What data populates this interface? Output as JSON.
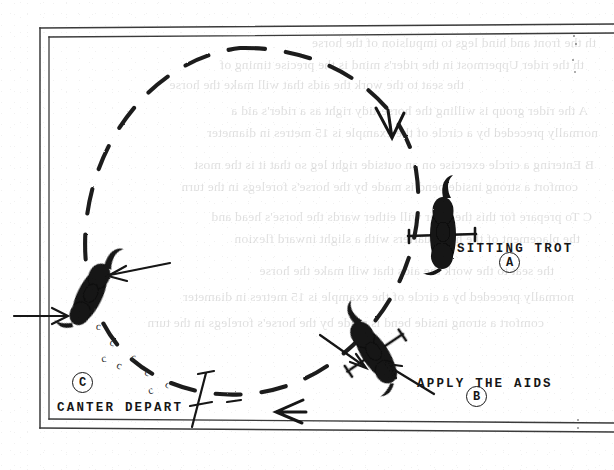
{
  "figure": {
    "type": "instructional-diagram",
    "background_color": "#ffffff",
    "ink_color": "#161616"
  },
  "arena": {
    "name": "riding-arena",
    "wall_style": "double-line",
    "open_side": "right",
    "entry_arrow": "arrow pointing right through left wall"
  },
  "path": {
    "name": "circle-track",
    "style": "dashed",
    "direction": "counter-clockwise",
    "arrowheads": 2
  },
  "labels": [
    {
      "id": "A",
      "marker": "A",
      "text": "SITTING TROT",
      "x": 457,
      "y": 248,
      "marker_x": 499,
      "marker_y": 262
    },
    {
      "id": "B",
      "marker": "B",
      "text": "APPLY THE AIDS",
      "x": 417,
      "y": 383,
      "marker_x": 466,
      "marker_y": 396
    },
    {
      "id": "C",
      "marker": "C",
      "text": "CANTER DEPART",
      "x": 57,
      "y": 407,
      "marker_x": 72,
      "marker_y": 382
    }
  ],
  "horses": [
    {
      "id": "horse-a",
      "label": "A",
      "note": "sitting trot, travelling down on right of circle"
    },
    {
      "id": "horse-b",
      "label": "B",
      "note": "aids applied, angled on circle"
    },
    {
      "id": "horse-c",
      "label": "C",
      "note": "canter depart, leaving circle to the left"
    }
  ],
  "hoofprints": {
    "name": "hoofprint-trail",
    "glyph": "c",
    "count": 8
  },
  "ghost_text": [
    "th the front and hind legs to impulsion of the horse",
    "th the rider  Uppermost in the rider's mind is the precise timing of",
    "the seat to the work  the aids that will make the horse",
    "A   the rider group is willing the horse-tidy right  as a rider's aid a",
    "normally preceded by a circle of the example is 15 metres in diameter",
    "B  Entering a circle exercise on an outside right leg so that it is the most",
    "comfort a strong inside bend is made by the horse's forelegs in the turn",
    "C  To prepare for this the rider will either  wards the horse's head and",
    "the placement of the hindquarters with a slight inward flexion"
  ],
  "markers": {
    "canter_pole": "slanted pole with crossbars at circle exit"
  }
}
